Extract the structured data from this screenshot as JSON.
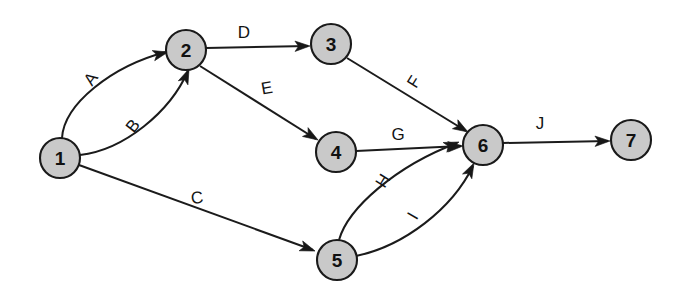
{
  "diagram": {
    "type": "directed-graph",
    "canvas": {
      "width": 683,
      "height": 304
    },
    "background_color": "#ffffff",
    "node_fill_color": "#c9c9c9",
    "node_stroke_color": "#1a1a1a",
    "edge_color": "#1b1b1b",
    "label_color": "#131313",
    "nodes": [
      {
        "id": "1",
        "label": "1",
        "cx": 60,
        "cy": 158,
        "r": 20
      },
      {
        "id": "2",
        "label": "2",
        "cx": 186,
        "cy": 50,
        "r": 20
      },
      {
        "id": "3",
        "label": "3",
        "cx": 331,
        "cy": 44,
        "r": 20
      },
      {
        "id": "4",
        "label": "4",
        "cx": 336,
        "cy": 152,
        "r": 20
      },
      {
        "id": "5",
        "label": "5",
        "cx": 337,
        "cy": 260,
        "r": 20
      },
      {
        "id": "6",
        "label": "6",
        "cx": 483,
        "cy": 145,
        "r": 20
      },
      {
        "id": "7",
        "label": "7",
        "cx": 631,
        "cy": 140,
        "r": 20
      }
    ],
    "edges": [
      {
        "id": "A",
        "label": "A",
        "from": "1",
        "to": "2",
        "shape": "curved-upper",
        "path": "M 62 138 C 64 104 112 66 166 52",
        "arrow": {
          "x": 168,
          "y": 52,
          "angle": -14
        },
        "label_pos": {
          "x": 91,
          "y": 79,
          "rotate": -54
        }
      },
      {
        "id": "B",
        "label": "B",
        "from": "1",
        "to": "2",
        "shape": "curved-lower",
        "path": "M 80 155 C 124 150 170 112 188 71",
        "arrow": {
          "x": 189,
          "y": 69,
          "angle": -67
        },
        "label_pos": {
          "x": 133,
          "y": 126,
          "rotate": -52
        }
      },
      {
        "id": "C",
        "label": "C",
        "from": "1",
        "to": "5",
        "shape": "straight",
        "path": "M 79 165 L 313 250",
        "arrow": {
          "x": 315,
          "y": 251,
          "angle": 20
        },
        "label_pos": {
          "x": 197,
          "y": 198,
          "rotate": -8
        }
      },
      {
        "id": "D",
        "label": "D",
        "from": "2",
        "to": "3",
        "shape": "straight",
        "path": "M 206 48 L 308 46",
        "arrow": {
          "x": 310,
          "y": 46,
          "angle": -1
        },
        "label_pos": {
          "x": 244,
          "y": 32,
          "rotate": 0
        }
      },
      {
        "id": "E",
        "label": "E",
        "from": "2",
        "to": "4",
        "shape": "straight",
        "path": "M 200 66 L 316 139",
        "arrow": {
          "x": 318,
          "y": 140,
          "angle": 32
        },
        "label_pos": {
          "x": 267,
          "y": 88,
          "rotate": -10
        }
      },
      {
        "id": "F",
        "label": "F",
        "from": "3",
        "to": "6",
        "shape": "straight",
        "path": "M 347 58 L 466 131",
        "arrow": {
          "x": 468,
          "y": 132,
          "angle": 31
        },
        "label_pos": {
          "x": 414,
          "y": 82,
          "rotate": -58
        }
      },
      {
        "id": "G",
        "label": "G",
        "from": "4",
        "to": "6",
        "shape": "straight",
        "path": "M 356 151 L 461 146",
        "arrow": {
          "x": 463,
          "y": 146,
          "angle": -3
        },
        "label_pos": {
          "x": 398,
          "y": 134,
          "rotate": 0
        }
      },
      {
        "id": "H",
        "label": "H",
        "from": "5",
        "to": "6",
        "shape": "curved-upper",
        "path": "M 339 240 C 348 208 396 166 457 143",
        "arrow": {
          "x": 459,
          "y": 142,
          "angle": -21
        },
        "label_pos": {
          "x": 383,
          "y": 181,
          "rotate": -58
        }
      },
      {
        "id": "I",
        "label": "I",
        "from": "5",
        "to": "6",
        "shape": "curved-lower",
        "path": "M 356 256 C 404 246 452 209 473 166",
        "arrow": {
          "x": 474,
          "y": 163,
          "angle": -63
        },
        "label_pos": {
          "x": 413,
          "y": 216,
          "rotate": -60
        }
      },
      {
        "id": "J",
        "label": "J",
        "from": "6",
        "to": "7",
        "shape": "straight",
        "path": "M 503 143 L 608 141",
        "arrow": {
          "x": 610,
          "y": 141,
          "angle": -1
        },
        "label_pos": {
          "x": 540,
          "y": 123,
          "rotate": 0
        }
      }
    ]
  }
}
